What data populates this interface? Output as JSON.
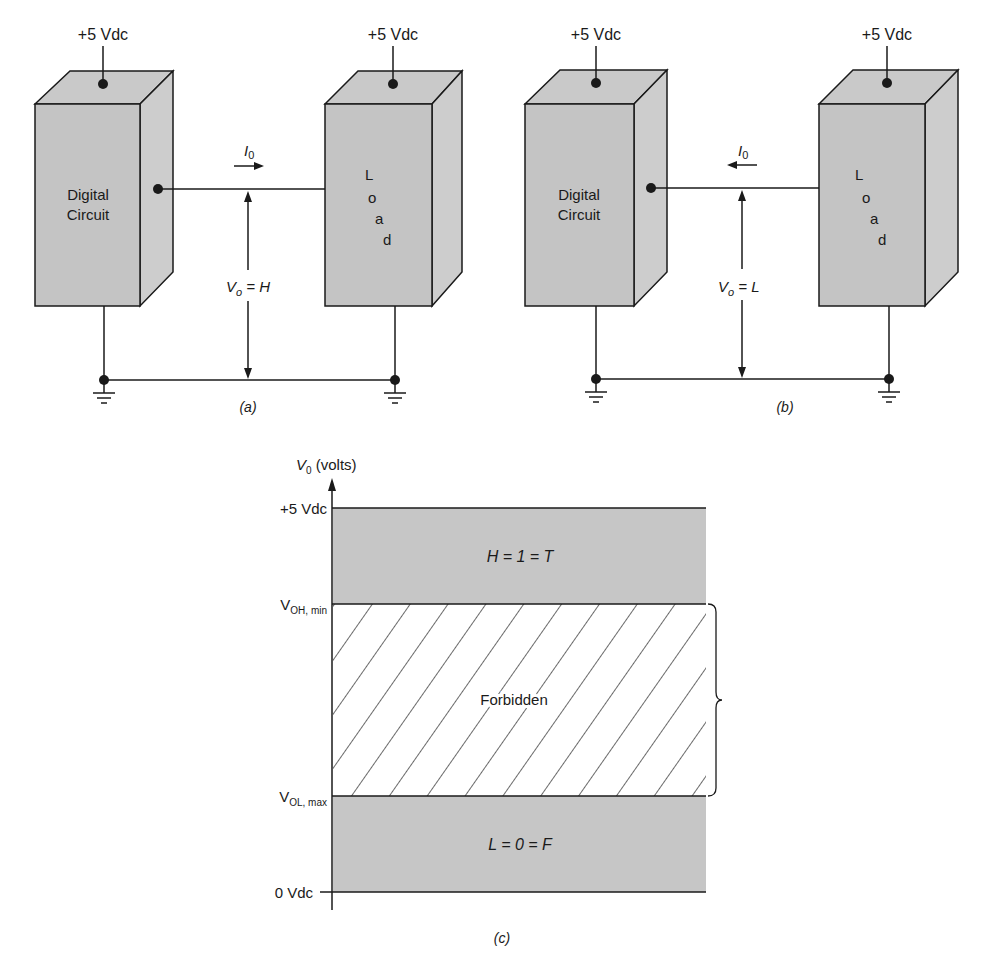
{
  "panel_a": {
    "caption": "(a)",
    "supply_left": "+5 Vdc",
    "supply_right": "+5 Vdc",
    "circuit_label_line1": "Digital",
    "circuit_label_line2": "Circuit",
    "load_letters": [
      "L",
      "o",
      "a",
      "d"
    ],
    "current_label": "I",
    "current_subscript": "0",
    "current_direction": "right",
    "voltage_label": "V",
    "voltage_subscript": "o",
    "voltage_value": " = H"
  },
  "panel_b": {
    "caption": "(b)",
    "supply_left": "+5 Vdc",
    "supply_right": "+5 Vdc",
    "circuit_label_line1": "Digital",
    "circuit_label_line2": "Circuit",
    "load_letters": [
      "L",
      "o",
      "a",
      "d"
    ],
    "current_label": "I",
    "current_subscript": "0",
    "current_direction": "left",
    "voltage_label": "V",
    "voltage_subscript": "o",
    "voltage_value": " = L"
  },
  "panel_c": {
    "caption": "(c)",
    "axis_label": "V",
    "axis_subscript": "0",
    "axis_unit": " (volts)",
    "levels": {
      "top": "+5 Vdc",
      "voh_main": "V",
      "voh_sub": "OH, min",
      "vol_main": "V",
      "vol_sub": "OL, max",
      "bottom": "0 Vdc"
    },
    "bands": {
      "high": "H = 1 = T",
      "forbidden": "Forbidden",
      "low": "L = 0 = F"
    }
  },
  "colors": {
    "box_fill": "#c4c4c4",
    "box_side": "#cdcdcd",
    "band_fill": "#c6c6c6",
    "stroke": "#1a1a1a"
  }
}
